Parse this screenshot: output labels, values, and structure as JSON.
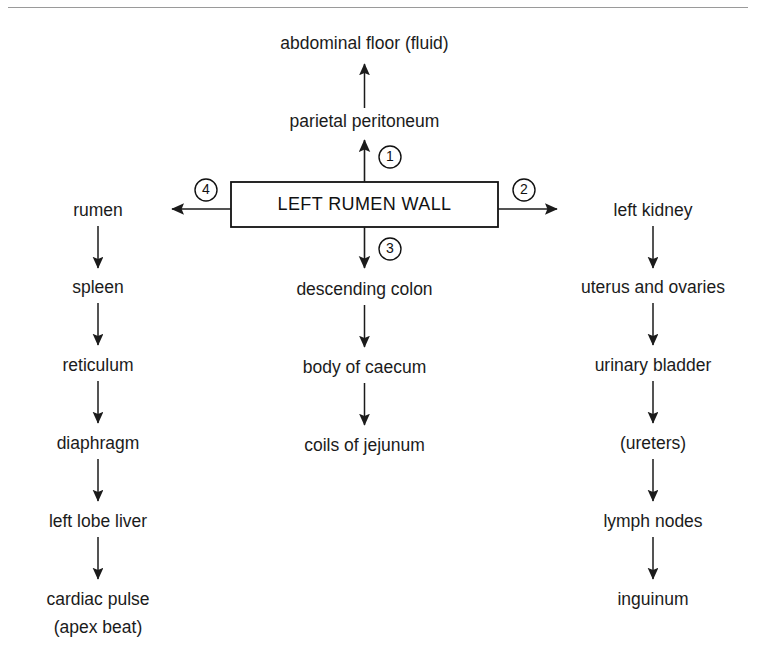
{
  "diagram": {
    "title": "LEFT RUMEN WALL",
    "center_box": {
      "label": "LEFT RUMEN WALL"
    },
    "markers": {
      "one": "1",
      "two": "2",
      "three": "3",
      "four": "4"
    },
    "up_chain": {
      "marker": "1",
      "direction": "up",
      "nodes": [
        {
          "label": "parietal peritoneum"
        },
        {
          "label": "abdominal floor (fluid)"
        }
      ]
    },
    "left_chain": {
      "marker": "4",
      "direction": "left",
      "nodes": [
        {
          "label": "rumen"
        },
        {
          "label": "spleen"
        },
        {
          "label": "reticulum"
        },
        {
          "label": "diaphragm"
        },
        {
          "label": "left lobe liver"
        },
        {
          "label": "cardiac pulse",
          "label2": "(apex beat)"
        }
      ]
    },
    "down_chain": {
      "marker": "3",
      "direction": "down",
      "nodes": [
        {
          "label": "descending colon"
        },
        {
          "label": "body of caecum"
        },
        {
          "label": "coils of jejunum"
        }
      ]
    },
    "right_chain": {
      "marker": "2",
      "direction": "right",
      "nodes": [
        {
          "label": "left kidney"
        },
        {
          "label": "uterus and ovaries"
        },
        {
          "label": "urinary bladder"
        },
        {
          "label": "(ureters)"
        },
        {
          "label": "lymph nodes"
        },
        {
          "label": "inguinum"
        }
      ]
    },
    "colors": {
      "ink": "#1b1b1b",
      "background": "#ffffff",
      "rule": "#9a9a9a"
    }
  }
}
